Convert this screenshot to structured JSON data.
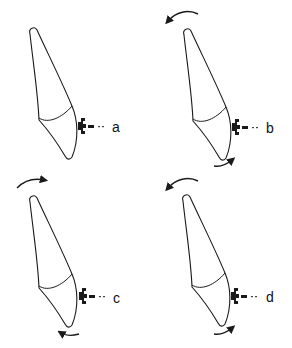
{
  "figure": {
    "panels": [
      {
        "label": "a",
        "rotation": "none",
        "arrows": []
      },
      {
        "label": "b",
        "rotation": "root lingual / crown labial",
        "arrows": [
          "apical-counterclockwise",
          "incisal-counterclockwise"
        ]
      },
      {
        "label": "c",
        "rotation": "root labial / crown lingual",
        "arrows": [
          "apical-clockwise",
          "incisal-clockwise"
        ]
      },
      {
        "label": "d",
        "rotation": "root lingual / crown labial",
        "arrows": [
          "apical-counterclockwise",
          "incisal-counterclockwise"
        ]
      }
    ]
  },
  "colors": {
    "line": "#1a1a1a",
    "background": "#ffffff"
  }
}
